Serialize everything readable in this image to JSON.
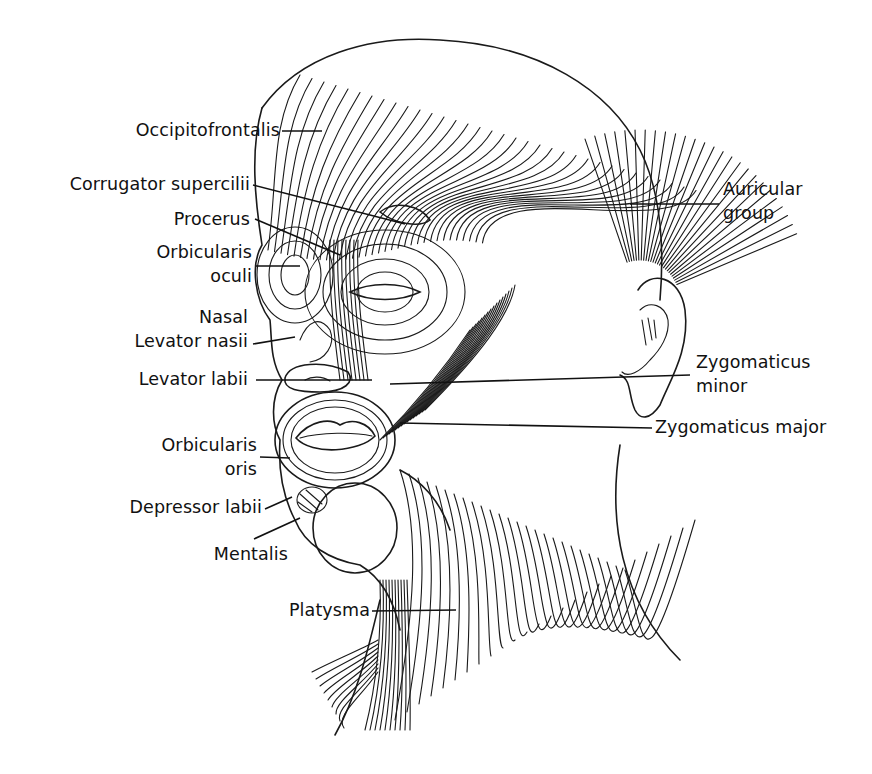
{
  "figure": {
    "style": "line illustration",
    "colors": {
      "ink": "#111111",
      "background": "#ffffff"
    }
  },
  "labels": {
    "occipitofrontalis": "Occipitofrontalis",
    "corrugator": "Corrugator supercilii",
    "procerus": "Procerus",
    "orbicularis_oculi_1": "Orbicularis",
    "orbicularis_oculi_2": "oculi",
    "nasal": "Nasal",
    "levator_nasii": "Levator nasii",
    "levator_labii": "Levator labii",
    "orbicularis_oris_1": "Orbicularis",
    "orbicularis_oris_2": "oris",
    "depressor_labii": "Depressor labii",
    "mentalis": "Mentalis",
    "platysma": "Platysma",
    "auricular_1": "Auricular",
    "auricular_2": "group",
    "zygomaticus_minor_1": "Zygomaticus",
    "zygomaticus_minor_2": "minor",
    "zygomaticus_major": "Zygomaticus major"
  }
}
